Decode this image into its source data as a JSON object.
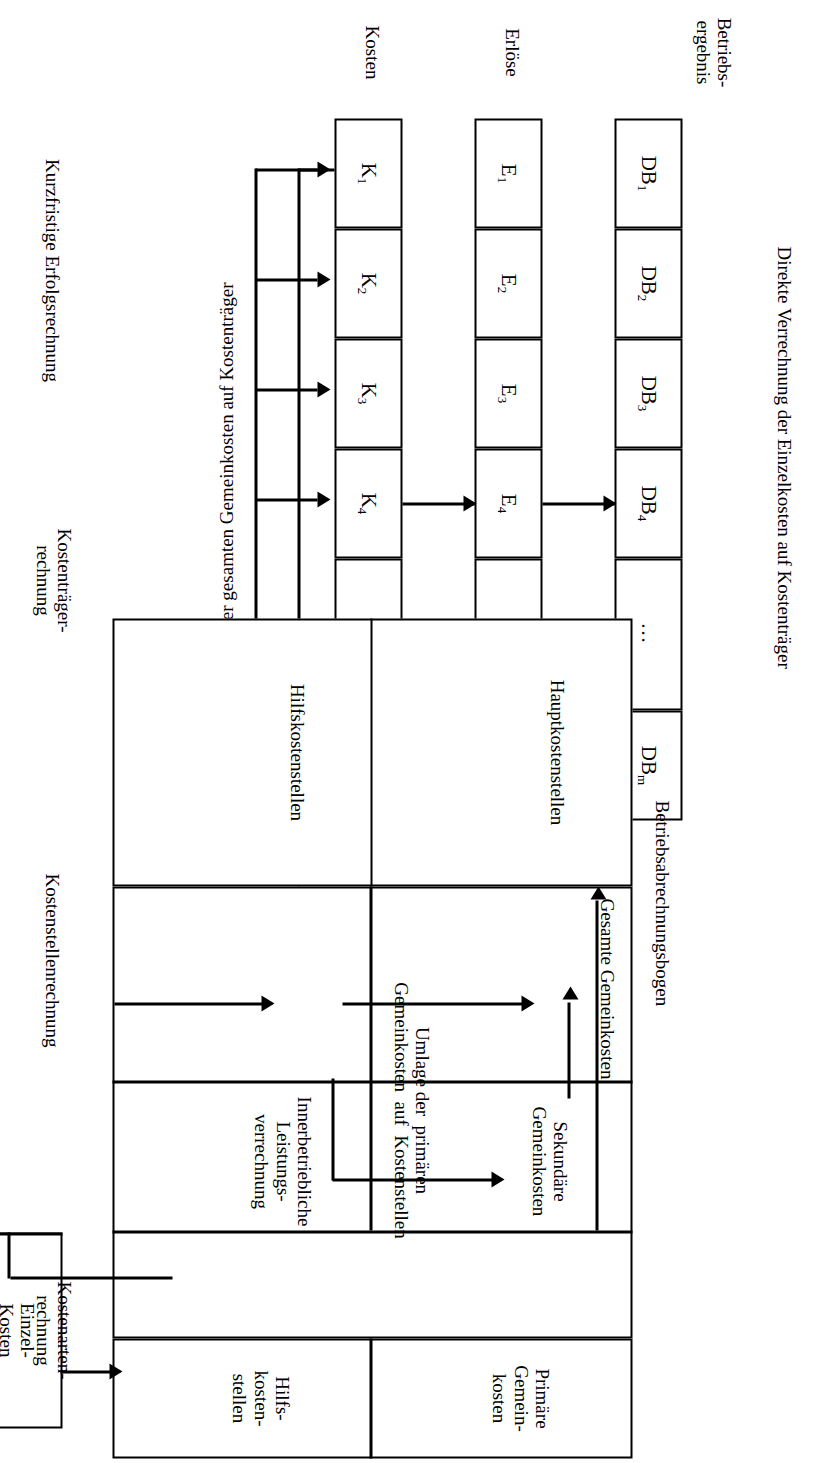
{
  "diagram": {
    "top_label": "Direkte Verrechnung der Einzelkosten auf Kostenträger",
    "umlage_label": "Umlage der gesamten Gemeinkosten auf Kostenträger"
  },
  "row_labels": {
    "betriebsergebnis": "Betriebs-\nergebnis",
    "erloese": "Erlöse",
    "kosten": "Kosten"
  },
  "stage_labels": [
    {
      "id": "kurzfristige-erfolgsrechnung",
      "text": "Kurzfristige Erfolgsrechnung"
    },
    {
      "id": "kostentraegerrechnung",
      "text": "Kostenträger-\nrechnung"
    },
    {
      "id": "kostenstellenrechnung",
      "text": "Kostenstellenrechnung"
    },
    {
      "id": "kostenartenrechnung",
      "text": "Kostenarten-\nrechnung"
    }
  ],
  "rows": {
    "db": {
      "label": "Betriebs-\nergebnis",
      "cells": [
        "DB|1",
        "DB|2",
        "DB|3",
        "DB|4",
        "…",
        "DB|m"
      ]
    },
    "e": {
      "label": "Erlöse",
      "cells": [
        "E|1",
        "E|2",
        "E|3",
        "E|4",
        "…",
        "E|m"
      ]
    },
    "k": {
      "label": "Kosten",
      "cells": [
        "K|1",
        "K|2",
        "K|3",
        "K|4",
        "…",
        "K|m"
      ]
    }
  },
  "bab": {
    "title": "Betriebsabrechnungsbogen",
    "columns": [
      {
        "id": "hilfskostenstellen",
        "label": "Hilfskostenstellen"
      },
      {
        "id": "hauptkostenstellen",
        "label": "Hauptkostenstellen"
      }
    ],
    "rows": [
      {
        "id": "primaere-gemeinkosten",
        "label": "Primäre\nGemein-\nkosten"
      },
      {
        "id": "hilfskostenstellen-row",
        "label": "Hilfs-\nkosten-\nstellen"
      }
    ],
    "body_labels": [
      {
        "id": "umlage-primaere",
        "text": "Umlage der  primären\nGemeinkosten  auf  Kostenstellen"
      },
      {
        "id": "innerbetriebliche-leistungsverrechnung",
        "text": "Innerbetriebliche\nLeistungs-\nverrechnung"
      },
      {
        "id": "sekundaere-gemeinkosten",
        "text": "Sekundäre\nGemeinkosten"
      },
      {
        "id": "gesamte-gemeinkosten",
        "text": "Gesamte Gemeinkosten"
      }
    ]
  },
  "kostenarten_box": {
    "cells": [
      {
        "id": "einzelkosten",
        "label": "Einzel-\nKosten"
      },
      {
        "id": "primaere-gemeinkosten-art",
        "label": "Primäre\nGemein-\nkosten"
      }
    ]
  },
  "colors": {
    "stroke": "#000000",
    "background": "#ffffff"
  }
}
